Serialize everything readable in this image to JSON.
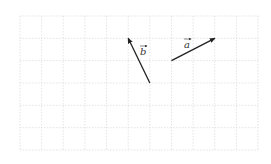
{
  "diagram": {
    "type": "vector-grid",
    "grid": {
      "origin_px": [
        20,
        16
      ],
      "cols": 11,
      "rows": 6,
      "cell_px": 21.64,
      "cell_py": 22.33,
      "line_color": "#d9d9d9"
    },
    "vectors": [
      {
        "name": "b",
        "label": "b",
        "tail_grid": [
          6,
          3
        ],
        "head_grid": [
          5,
          1
        ],
        "color": "#222222",
        "label_pos_px": [
          143,
          55
        ]
      },
      {
        "name": "a",
        "label": "a",
        "tail_grid": [
          7,
          2
        ],
        "head_grid": [
          9,
          1
        ],
        "color": "#222222",
        "label_pos_px": [
          187,
          48
        ]
      }
    ]
  }
}
